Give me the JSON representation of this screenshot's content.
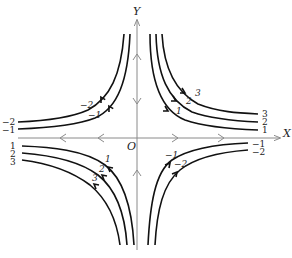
{
  "diagram": {
    "axes": {
      "x_label": "X",
      "y_label": "Y",
      "origin_label": "O"
    },
    "quadrants": {
      "top_right": {
        "end_labels": [
          "3",
          "2",
          "1"
        ],
        "curve_labels": [
          "3",
          "2",
          "1"
        ]
      },
      "top_left": {
        "end_labels": [
          "-2",
          "-1"
        ],
        "curve_labels": [
          "-2",
          "-1"
        ]
      },
      "bottom_left": {
        "end_labels": [
          "1",
          "2",
          "3"
        ],
        "curve_labels": [
          "1",
          "2",
          "3"
        ]
      },
      "bottom_right": {
        "end_labels": [
          "-1",
          "-2"
        ],
        "curve_labels": [
          "-1",
          "-2"
        ]
      }
    },
    "colors": {
      "axis": "#8a8a8a",
      "streamline": "#111111",
      "background": "#ffffff"
    }
  }
}
